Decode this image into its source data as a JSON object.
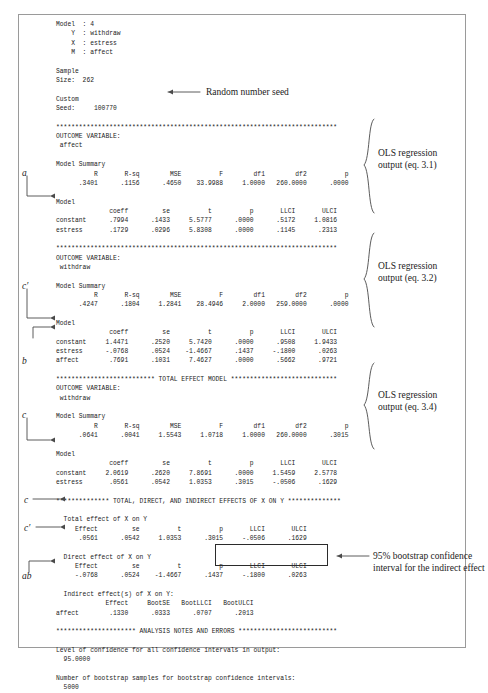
{
  "document": {
    "kind": "statistical-output-figure",
    "frame_visible": true
  },
  "console_output": {
    "lines": [
      "Model  : 4",
      "    Y  : withdraw",
      "    X  : estress",
      "    M  : affect",
      "",
      "Sample",
      "Size:  262",
      "",
      "Custom",
      "Seed:     100770",
      "",
      "**************************************************************************",
      "OUTCOME VARIABLE:",
      " affect",
      "",
      "Model Summary",
      "          R       R-sq        MSE          F        df1        df2          p",
      "      .3401      .1156      .4650    33.9988     1.0000   260.0000      .0000",
      "",
      "Model",
      "              coeff         se          t          p       LLCI       ULCI",
      "constant      .7994      .1433     5.5777      .0000      .5172     1.0816",
      "estress       .1729      .0296     5.8308      .0000      .1145      .2313",
      "",
      "**************************************************************************",
      "OUTCOME VARIABLE:",
      " withdraw",
      "",
      "Model Summary",
      "          R       R-sq        MSE          F        df1        df2          p",
      "      .4247      .1804     1.2841    28.4946     2.0000   259.0000      .0000",
      "",
      "Model",
      "              coeff         se          t          p       LLCI       ULCI",
      "constant     1.4471      .2520     5.7420      .0000      .9508     1.9433",
      "estress      -.0768      .0524    -1.4667      .1437     -.1800      .0263",
      "affect        .7691      .1031     7.4627      .0000      .5662      .9721",
      "",
      "************************** TOTAL EFFECT MODEL ****************************",
      "OUTCOME VARIABLE:",
      " withdraw",
      "",
      "Model Summary",
      "          R       R-sq        MSE          F        df1        df2          p",
      "      .0641      .0041     1.5543     1.0718     1.0000   260.0000      .3015",
      "",
      "Model",
      "              coeff         se          t          p       LLCI       ULCI",
      "constant     2.0619      .2620     7.8691      .0000     1.5459     2.5778",
      "estress       .0561      .0542     1.0353      .3015     -.0506      .1629",
      "",
      "************** TOTAL, DIRECT, AND INDIRECT EFFECTS OF X ON Y **************",
      "",
      "  Total effect of X on Y",
      "     Effect         se          t          p       LLCI       ULCI",
      "      .0561      .0542     1.0353      .3015     -.0506      .1629",
      "",
      "  Direct effect of X on Y",
      "     Effect         se          t          p       LLCI       ULCI",
      "     -.0768      .0524    -1.4667      .1437     -.1800      .0263",
      "",
      "  Indirect effect(s) of X on Y:",
      "             Effect     BootSE   BootLLCI   BootULCI",
      "affect        .1330      .0333      .0707      .2013",
      "",
      "********************* ANALYSIS NOTES AND ERRORS **************************",
      "",
      "Level of confidence for all confidence intervals in output:",
      "  95.0000",
      "",
      "Number of bootstrap samples for bootstrap confidence intervals:",
      "  5000"
    ]
  },
  "annotations": {
    "seed_note": "Random number seed",
    "ols_eq31_line1": "OLS regression",
    "ols_eq31_line2": "output (eq. 3.1)",
    "ols_eq32_line1": "OLS regression",
    "ols_eq32_line2": "output (eq. 3.2)",
    "ols_eq34_line1": "OLS regression",
    "ols_eq34_line2": "output (eq. 3.4)",
    "boot_ci_line1": "95% bootstrap confidence",
    "boot_ci_line2": "interval for the indirect effect"
  },
  "path_labels": {
    "a": "a",
    "c_prime_upper": "c′",
    "b": "b",
    "c": "c",
    "c_total": "c",
    "c_prime_direct": "c′",
    "ab": "ab"
  },
  "colors": {
    "text": "#1b1b1b",
    "frame": "#9a9a9a",
    "box_outline": "#2b2b2b",
    "background": "#ffffff"
  }
}
